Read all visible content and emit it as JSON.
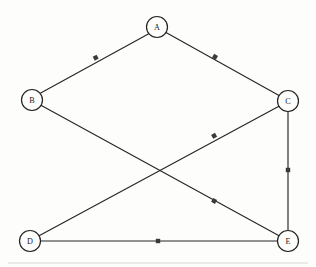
{
  "diagram": {
    "width": 316,
    "height": 267,
    "background_color": "#fdfdfc",
    "ink_color": "#262626",
    "node_radius": 10.5,
    "nodes": [
      {
        "id": "A",
        "label": "A",
        "x": 157,
        "y": 27
      },
      {
        "id": "B",
        "label": "B",
        "x": 32,
        "y": 100
      },
      {
        "id": "C",
        "label": "C",
        "x": 288,
        "y": 101
      },
      {
        "id": "D",
        "label": "D",
        "x": 30,
        "y": 241
      },
      {
        "id": "E",
        "label": "E",
        "x": 288,
        "y": 241
      }
    ],
    "edges": [
      {
        "id": "edge-a-b",
        "from": "A",
        "to": "B",
        "label": "",
        "label_x": 96,
        "label_y": 58
      },
      {
        "id": "edge-a-c",
        "from": "A",
        "to": "C",
        "label": "",
        "label_x": 215,
        "label_y": 57
      },
      {
        "id": "edge-c-d",
        "from": "C",
        "to": "D",
        "label": "",
        "label_x": 214,
        "label_y": 136
      },
      {
        "id": "edge-b-e",
        "from": "B",
        "to": "E",
        "label": "",
        "label_x": 214,
        "label_y": 201
      },
      {
        "id": "edge-c-e",
        "from": "C",
        "to": "E",
        "label": "",
        "label_x": 288,
        "label_y": 170
      },
      {
        "id": "edge-d-e",
        "from": "D",
        "to": "E",
        "label": "",
        "label_x": 158,
        "label_y": 241
      }
    ],
    "artifact": {
      "visible": true,
      "y": 263
    }
  }
}
